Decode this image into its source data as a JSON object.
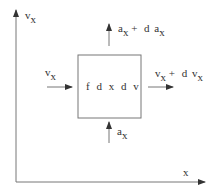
{
  "diagram": {
    "axes": {
      "y_label": {
        "base": "v",
        "sub": "x"
      },
      "x_label": "x"
    },
    "box": {
      "label": "f d x  d v"
    },
    "flows": {
      "left_in": {
        "base": "v",
        "sub": "x"
      },
      "right_out": {
        "base": "v",
        "sub": "x",
        "plus": "+ d",
        "base2": "v",
        "sub2": "x"
      },
      "bottom_in": {
        "base": "a",
        "sub": "x"
      },
      "top_out": {
        "base": "a",
        "sub": "x",
        "plus": "+ d",
        "base2": "a",
        "sub2": "x"
      }
    },
    "colors": {
      "stroke": "#666666",
      "text": "#333333"
    }
  }
}
